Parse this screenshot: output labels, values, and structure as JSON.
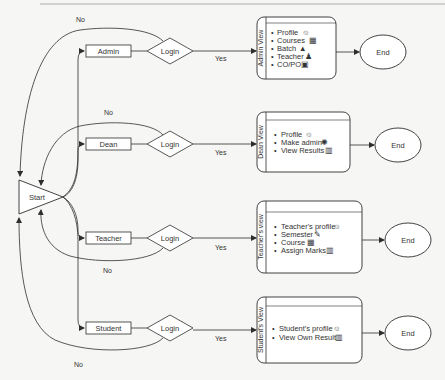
{
  "diagram": {
    "start": {
      "label": "Start"
    },
    "no_label": "No",
    "yes_label": "Yes",
    "end_label": "End",
    "roles": [
      {
        "name": "Admin",
        "decision": "Login",
        "view_title": "Admin View",
        "items": [
          {
            "label": "Profile",
            "icon": "user-circle-icon",
            "glyph": "☺"
          },
          {
            "label": "Courses",
            "icon": "building-icon",
            "glyph": "▦"
          },
          {
            "label": "Batch",
            "icon": "group-icon",
            "glyph": "▲"
          },
          {
            "label": "Teacher",
            "icon": "person-icon",
            "glyph": "♟"
          },
          {
            "label": "CO/PO",
            "icon": "document-icon",
            "glyph": "▣"
          }
        ]
      },
      {
        "name": "Dean",
        "decision": "Login",
        "view_title": "Dean View",
        "items": [
          {
            "label": "Profile",
            "icon": "user-circle-icon",
            "glyph": "☺"
          },
          {
            "label": "Make admin",
            "icon": "gear-icon",
            "glyph": "✺"
          },
          {
            "label": "View Results",
            "icon": "trash-icon",
            "glyph": "▥"
          }
        ]
      },
      {
        "name": "Teacher",
        "decision": "Login",
        "view_title": "Teacher's view",
        "items": [
          {
            "label": "Teacher's profile",
            "icon": "user-circle-icon",
            "glyph": "☺"
          },
          {
            "label": "Semester",
            "icon": "edit-icon",
            "glyph": "✎"
          },
          {
            "label": "Course",
            "icon": "building-icon",
            "glyph": "▦"
          },
          {
            "label": "Assign Marks",
            "icon": "trash-icon",
            "glyph": "▥"
          }
        ]
      },
      {
        "name": "Student",
        "decision": "Login",
        "view_title": "Student's View",
        "items": [
          {
            "label": "Student's profile",
            "icon": "user-circle-icon",
            "glyph": "☺"
          },
          {
            "label": "View Own Result",
            "icon": "trash-icon",
            "glyph": "▥"
          }
        ]
      }
    ]
  },
  "colors": {
    "stroke": "#2e2e2e",
    "fill": "#ffffff",
    "text": "#333333",
    "background": "#f6f6f4"
  }
}
